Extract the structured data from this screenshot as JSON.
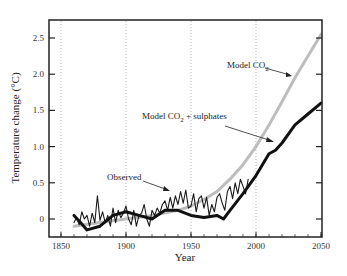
{
  "chart_data": {
    "type": "line",
    "title": "",
    "xlabel": "Year",
    "ylabel": "Temperature change (°C)",
    "xlim": [
      1840,
      2050
    ],
    "ylim": [
      -0.2,
      2.7
    ],
    "x_ticks": [
      "1850",
      "1900",
      "1950",
      "2000",
      "2050"
    ],
    "y_ticks": [
      "0",
      "0.5",
      "1.0",
      "1.5",
      "2.0",
      "2.5"
    ],
    "grid": "vertical dotted lines at 1850, 1900, 1950, 2000",
    "legend": "none (inline annotations with arrows)",
    "series": [
      {
        "name": "Observed",
        "style": "thin black, noisy",
        "x": [
          1860,
          1862,
          1864,
          1866,
          1868,
          1870,
          1872,
          1874,
          1876,
          1878,
          1880,
          1882,
          1884,
          1886,
          1888,
          1890,
          1892,
          1894,
          1896,
          1898,
          1900,
          1902,
          1904,
          1906,
          1908,
          1910,
          1912,
          1914,
          1916,
          1918,
          1920,
          1922,
          1924,
          1926,
          1928,
          1930,
          1932,
          1934,
          1936,
          1938,
          1940,
          1942,
          1944,
          1946,
          1948,
          1950,
          1952,
          1954,
          1956,
          1958,
          1960,
          1962,
          1964,
          1966,
          1968,
          1970,
          1972,
          1974,
          1976,
          1978,
          1980,
          1982,
          1984,
          1986,
          1988,
          1990,
          1992,
          1994
        ],
        "y": [
          -0.05,
          0.02,
          -0.08,
          0.1,
          0.0,
          0.05,
          -0.1,
          0.08,
          -0.05,
          0.32,
          -0.02,
          0.1,
          -0.05,
          0.05,
          -0.1,
          0.15,
          -0.05,
          0.12,
          0.02,
          0.08,
          0.18,
          0.0,
          -0.08,
          0.12,
          -0.1,
          0.05,
          0.08,
          0.2,
          0.0,
          -0.1,
          0.12,
          0.05,
          0.15,
          0.08,
          0.2,
          0.25,
          0.12,
          0.3,
          0.15,
          0.32,
          0.2,
          0.38,
          0.22,
          0.4,
          0.15,
          0.18,
          0.35,
          0.1,
          0.28,
          0.32,
          0.15,
          0.3,
          0.05,
          0.2,
          0.1,
          0.3,
          0.35,
          0.22,
          0.12,
          0.38,
          0.45,
          0.28,
          0.5,
          0.35,
          0.55,
          0.45,
          0.35,
          0.55
        ]
      },
      {
        "name": "Model CO2",
        "style": "thick light gray",
        "x": [
          1860,
          1880,
          1900,
          1920,
          1940,
          1950,
          1960,
          1970,
          1980,
          1990,
          2000,
          2010,
          2020,
          2030,
          2040,
          2050
        ],
        "y": [
          -0.1,
          -0.05,
          0.0,
          0.05,
          0.12,
          0.18,
          0.27,
          0.38,
          0.55,
          0.75,
          1.0,
          1.3,
          1.62,
          1.95,
          2.25,
          2.55
        ]
      },
      {
        "name": "Model CO2 + sulphates",
        "style": "thick black",
        "x": [
          1860,
          1865,
          1870,
          1880,
          1890,
          1900,
          1910,
          1920,
          1930,
          1940,
          1950,
          1960,
          1970,
          1975,
          1980,
          1990,
          2000,
          2010,
          2015,
          2020,
          2030,
          2040,
          2050
        ],
        "y": [
          0.05,
          -0.05,
          -0.15,
          -0.1,
          0.05,
          0.1,
          0.05,
          0.0,
          0.12,
          0.12,
          0.05,
          0.02,
          0.05,
          0.0,
          0.12,
          0.35,
          0.6,
          0.9,
          0.95,
          1.05,
          1.3,
          1.45,
          1.6
        ]
      }
    ],
    "annotations": [
      {
        "text": "Model CO",
        "subscript": "2",
        "suffix": "",
        "points_to": "Model CO2 curve near 2030"
      },
      {
        "text": "Model CO",
        "subscript": "2",
        "suffix": " + sulphates",
        "points_to": "sulphates curve near 2015"
      },
      {
        "text": "Observed",
        "points_to": "observed curve near 1935"
      }
    ]
  },
  "labels": {
    "xlabel": "Year",
    "ylabel": "Temperature change (°C)",
    "annot_co2": "Model CO",
    "annot_co2_sub": "2",
    "annot_sulph": "Model CO",
    "annot_sulph_sub": "2",
    "annot_sulph_suffix": " + sulphates",
    "annot_obs": "Observed"
  }
}
